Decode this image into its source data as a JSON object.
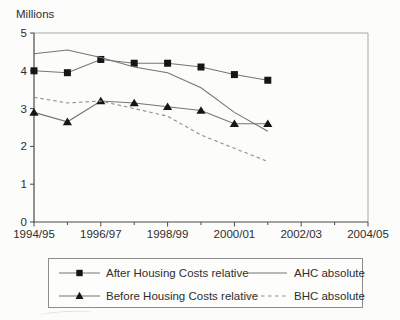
{
  "chart_data": {
    "type": "line",
    "title": "",
    "ylabel": "Millions",
    "xlabel": "",
    "ylim": [
      0,
      5
    ],
    "yticks": [
      0,
      1,
      2,
      3,
      4,
      5
    ],
    "x_major_tick_labels": [
      "1994/95",
      "1996/97",
      "1998/99",
      "2000/01",
      "2002/03",
      "2004/05"
    ],
    "x_axis_span_years": 10,
    "categories": [
      "1994/95",
      "1995/96",
      "1996/97",
      "1997/98",
      "1998/99",
      "1999/00",
      "2000/01",
      "2001/02"
    ],
    "grid": false,
    "legend_position": "bottom-box",
    "series": [
      {
        "name": "After Housing Costs relative",
        "marker": "square",
        "line_style": "solid",
        "values": [
          4.0,
          3.95,
          4.3,
          4.2,
          4.2,
          4.1,
          3.9,
          3.75
        ]
      },
      {
        "name": "AHC absolute",
        "marker": "none",
        "line_style": "solid",
        "values": [
          4.45,
          4.55,
          4.35,
          4.1,
          3.95,
          3.55,
          2.9,
          2.4
        ]
      },
      {
        "name": "Before Housing Costs relative",
        "marker": "triangle",
        "line_style": "solid",
        "values": [
          2.9,
          2.65,
          3.2,
          3.15,
          3.05,
          2.95,
          2.6,
          2.6
        ]
      },
      {
        "name": "BHC absolute",
        "marker": "none",
        "line_style": "dashed",
        "values": [
          3.3,
          3.15,
          3.2,
          3.0,
          2.8,
          2.3,
          1.95,
          1.6
        ]
      }
    ]
  },
  "colors": {
    "background": "#fcfcfb",
    "axis": "#4a4a4a",
    "plot_border": "#a8a8a8",
    "line": "#757575",
    "dashed_line": "#8f8f8f",
    "marker": "#161616",
    "text": "#2e2e2e",
    "legend_border": "#8d8d8d"
  }
}
